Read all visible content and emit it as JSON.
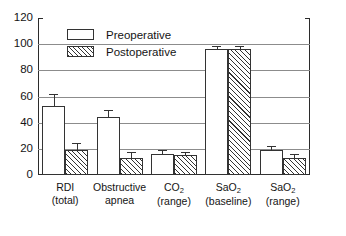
{
  "chart_data": {
    "type": "bar",
    "title": "",
    "subtitle": "",
    "xlabel": "",
    "ylabel": "",
    "ylim": [
      0,
      120
    ],
    "ytick_values": [
      0,
      20,
      40,
      60,
      80,
      100,
      120
    ],
    "ytick_labels": [
      "0",
      "20",
      "40",
      "60",
      "80",
      "100",
      "120"
    ],
    "grid": true,
    "grid_axis": "y",
    "legend_position": "upper-left-inside",
    "categories": [
      {
        "line1": "RDI",
        "line2": "(total)",
        "sub1": "",
        "sub2": ""
      },
      {
        "line1": "Obstructive",
        "line2": "apnea",
        "sub1": "",
        "sub2": ""
      },
      {
        "line1": "CO",
        "sub1": "2",
        "line2": "(range)",
        "sub2": ""
      },
      {
        "line1": "SaO",
        "sub1": "2",
        "line2": "(baseline)",
        "sub2": ""
      },
      {
        "line1": "SaO",
        "sub1": "2",
        "line2": "(range)",
        "sub2": ""
      }
    ],
    "series": [
      {
        "name": "Preoperative",
        "fill": "white",
        "values": [
          53,
          44,
          16,
          96,
          19
        ],
        "errors": [
          8,
          5,
          2,
          1.5,
          2.5
        ]
      },
      {
        "name": "Postoperative",
        "fill": "hatched",
        "values": [
          19,
          13,
          15,
          96,
          13
        ],
        "errors": [
          5,
          4,
          2,
          1.5,
          2.5
        ]
      }
    ]
  },
  "legend": {
    "items": [
      {
        "label": "Preoperative",
        "fill": "white"
      },
      {
        "label": "Postoperative",
        "fill": "hatched"
      }
    ]
  },
  "colors": {
    "axis": "#2b2b2b",
    "grid": "#8c8c8c",
    "bar_outline": "#333333",
    "bar_fill": "#ffffff",
    "text": "#141414",
    "background": "#ffffff"
  }
}
